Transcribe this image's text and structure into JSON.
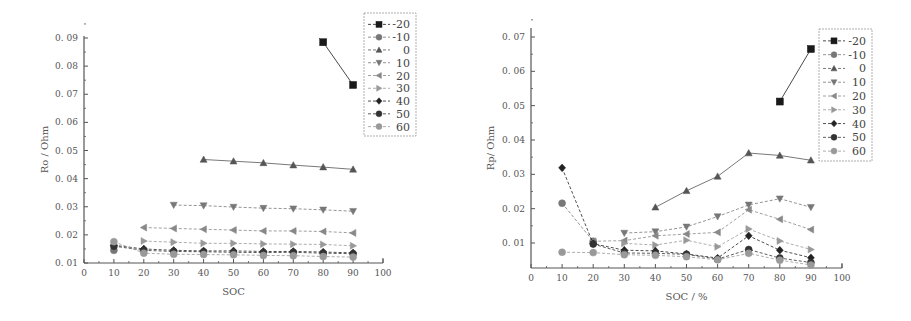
{
  "chart_data": [
    {
      "type": "line",
      "title": "",
      "xlabel": "SOC",
      "ylabel": "Ro / Ohm",
      "xlim": [
        0,
        100
      ],
      "ylim": [
        0.01,
        0.09
      ],
      "xticks": [
        "0",
        "10",
        "20",
        "30",
        "40",
        "50",
        "60",
        "70",
        "80",
        "90",
        "100"
      ],
      "yticks": [
        "0.01",
        "0.02",
        "0.03",
        "0.04",
        "0.05",
        "0.06",
        "0.07",
        "0.08",
        "0.09"
      ],
      "grid": false,
      "legend_position": "top-right",
      "series": [
        {
          "name": "-20",
          "marker": "square",
          "color": "#1a1a1a",
          "x": [
            80,
            90
          ],
          "y": [
            0.0885,
            0.0733
          ]
        },
        {
          "name": "-10",
          "marker": "circle",
          "color": "#777777",
          "x": [
            10
          ],
          "y": [
            0.0145
          ]
        },
        {
          "name": "0",
          "marker": "triangle-up",
          "color": "#555555",
          "x": [
            40,
            50,
            60,
            70,
            80,
            90
          ],
          "y": [
            0.0468,
            0.0462,
            0.0456,
            0.0448,
            0.0441,
            0.0433
          ]
        },
        {
          "name": "10",
          "marker": "triangle-down",
          "color": "#777777",
          "x": [
            30,
            40,
            50,
            60,
            70,
            80,
            90
          ],
          "y": [
            0.0306,
            0.0304,
            0.0299,
            0.0295,
            0.0293,
            0.0289,
            0.0284
          ]
        },
        {
          "name": "20",
          "marker": "triangle-left",
          "color": "#888888",
          "x": [
            20,
            30,
            40,
            50,
            60,
            70,
            80,
            90
          ],
          "y": [
            0.0226,
            0.0223,
            0.022,
            0.0217,
            0.0214,
            0.0214,
            0.0212,
            0.0207
          ]
        },
        {
          "name": "30",
          "marker": "triangle-right",
          "color": "#999999",
          "x": [
            20,
            30,
            40,
            50,
            60,
            70,
            80,
            90
          ],
          "y": [
            0.0178,
            0.0174,
            0.017,
            0.017,
            0.0168,
            0.0167,
            0.0166,
            0.0161
          ]
        },
        {
          "name": "40",
          "marker": "diamond",
          "color": "#222222",
          "x": [
            10,
            20,
            30,
            40,
            50,
            60,
            70,
            80,
            90
          ],
          "y": [
            0.0163,
            0.015,
            0.0145,
            0.0143,
            0.0143,
            0.0141,
            0.0141,
            0.0139,
            0.0136
          ]
        },
        {
          "name": "50",
          "marker": "circle",
          "color": "#333333",
          "x": [
            10,
            20,
            30,
            40,
            50,
            60,
            70,
            80,
            90
          ],
          "y": [
            0.016,
            0.0145,
            0.0141,
            0.014,
            0.0138,
            0.0137,
            0.0138,
            0.0135,
            0.0133
          ]
        },
        {
          "name": "60",
          "marker": "circle",
          "color": "#999999",
          "x": [
            10,
            20,
            30,
            40,
            50,
            60,
            70,
            80,
            90
          ],
          "y": [
            0.0176,
            0.0135,
            0.0131,
            0.013,
            0.0129,
            0.0127,
            0.0126,
            0.0123,
            0.0121
          ]
        }
      ]
    },
    {
      "type": "line",
      "title": "",
      "xlabel": "SOC / %",
      "ylabel": "Rp/ Ohm",
      "xlim": [
        0,
        100
      ],
      "ylim": [
        0.0027,
        0.07
      ],
      "xticks": [
        "0",
        "10",
        "20",
        "30",
        "40",
        "50",
        "60",
        "70",
        "80",
        "90",
        "100"
      ],
      "yticks": [
        "0.01",
        "0.02",
        "0.03",
        "0.04",
        "0.05",
        "0.06",
        "0.07"
      ],
      "grid": false,
      "legend_position": "top-right",
      "series": [
        {
          "name": "-20",
          "marker": "square",
          "color": "#1a1a1a",
          "x": [
            80,
            90
          ],
          "y": [
            0.0512,
            0.0665
          ]
        },
        {
          "name": "-10",
          "marker": "circle",
          "color": "#777777",
          "x": [
            10,
            20
          ],
          "y": [
            0.0216,
            0.0105
          ]
        },
        {
          "name": "0",
          "marker": "triangle-up",
          "color": "#555555",
          "x": [
            40,
            50,
            60,
            70,
            80,
            90
          ],
          "y": [
            0.0204,
            0.0252,
            0.0294,
            0.0362,
            0.0355,
            0.0341
          ]
        },
        {
          "name": "10",
          "marker": "triangle-down",
          "color": "#777777",
          "x": [
            30,
            40,
            50,
            60,
            70,
            80,
            90
          ],
          "y": [
            0.0129,
            0.0133,
            0.0147,
            0.0177,
            0.0211,
            0.0229,
            0.0204
          ]
        },
        {
          "name": "20",
          "marker": "triangle-left",
          "color": "#888888",
          "x": [
            20,
            30,
            40,
            50,
            60,
            70,
            80,
            90
          ],
          "y": [
            0.0105,
            0.0107,
            0.0121,
            0.0126,
            0.0131,
            0.0197,
            0.0169,
            0.0139
          ]
        },
        {
          "name": "30",
          "marker": "triangle-right",
          "color": "#999999",
          "x": [
            30,
            40,
            50,
            60,
            70,
            80,
            90
          ],
          "y": [
            0.0099,
            0.0094,
            0.0108,
            0.0089,
            0.0141,
            0.0106,
            0.0081
          ]
        },
        {
          "name": "40",
          "marker": "diamond",
          "color": "#222222",
          "x": [
            10,
            20,
            30,
            40,
            50,
            60,
            70,
            80,
            90
          ],
          "y": [
            0.0319,
            0.0098,
            0.0079,
            0.0077,
            0.0068,
            0.0056,
            0.0121,
            0.0079,
            0.0057
          ]
        },
        {
          "name": "50",
          "marker": "circle",
          "color": "#333333",
          "x": [
            20,
            30,
            40,
            50,
            60,
            70,
            80,
            90
          ],
          "y": [
            0.0097,
            0.0071,
            0.007,
            0.0067,
            0.0053,
            0.0081,
            0.0056,
            0.0043
          ]
        },
        {
          "name": "60",
          "marker": "circle",
          "color": "#999999",
          "x": [
            10,
            20,
            30,
            40,
            50,
            60,
            70,
            80,
            90
          ],
          "y": [
            0.0073,
            0.0072,
            0.0066,
            0.0064,
            0.006,
            0.0051,
            0.007,
            0.005,
            0.0036
          ]
        }
      ]
    }
  ]
}
